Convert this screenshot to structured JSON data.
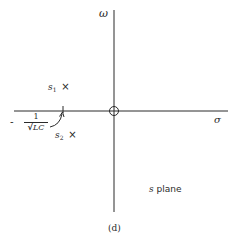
{
  "diagram": {
    "type": "pole-zero plot",
    "plane_label": {
      "symbol": "s",
      "text": " plane"
    },
    "caption": "(d)",
    "axes": {
      "vertical_label": "ω",
      "horizontal_label": "σ"
    },
    "poles": [
      {
        "name": "s",
        "subscript": "2",
        "marker": "×",
        "position": "upper-left, above real axis"
      },
      {
        "name": "s",
        "subscript": "1",
        "marker": "×",
        "position": "lower-left, below real axis"
      }
    ],
    "zeros": [
      {
        "marker": "○",
        "position": "origin"
      }
    ],
    "real_axis_mark": {
      "sign": "-",
      "numerator": "1",
      "radical": "√",
      "denominator": "LC",
      "meaning": "-1/√LC"
    }
  },
  "colors": {
    "ink": "#2a2a2a",
    "background": "#ffffff"
  }
}
